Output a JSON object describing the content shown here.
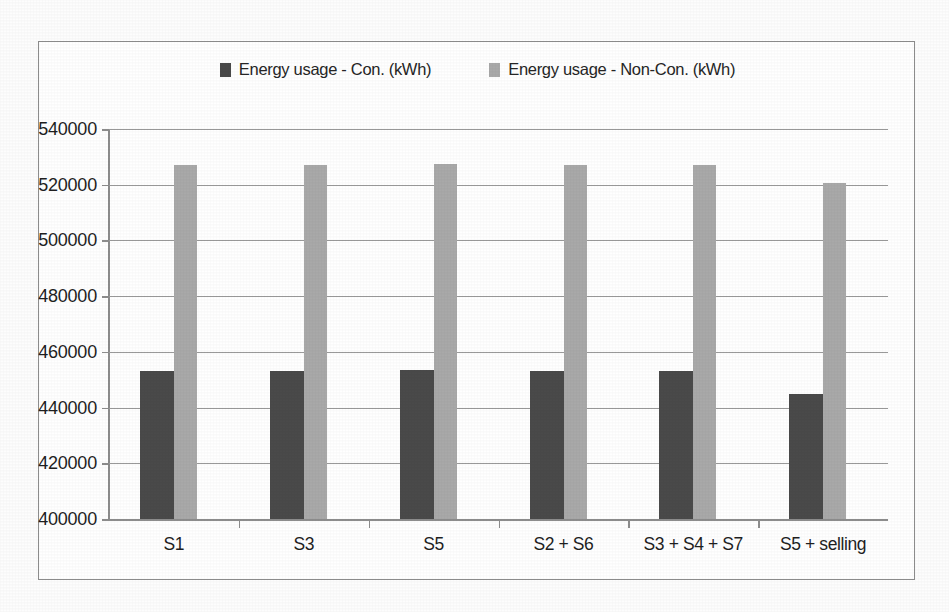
{
  "chart_data": {
    "type": "bar",
    "title": "",
    "xlabel": "",
    "ylabel": "",
    "categories": [
      "S1",
      "S3",
      "S5",
      "S2 + S6",
      "S3 + S4 + S7",
      "S5 + selling"
    ],
    "series": [
      {
        "name": "Energy usage - Con. (kWh)",
        "color": "#4a4a4a",
        "values": [
          453000,
          453000,
          453500,
          453000,
          453000,
          445000
        ]
      },
      {
        "name": "Energy usage - Non-Con. (kWh)",
        "color": "#a9a9a9",
        "values": [
          527000,
          527000,
          527500,
          527000,
          527000,
          520500
        ]
      }
    ],
    "ylim": [
      400000,
      540000
    ],
    "ytick_step": 20000,
    "ytick_labels": [
      "540000",
      "520000",
      "500000",
      "480000",
      "460000",
      "440000",
      "420000",
      "400000"
    ],
    "ytick_values": [
      540000,
      520000,
      500000,
      480000,
      460000,
      440000,
      420000,
      400000
    ],
    "grid": true,
    "legend_position": "top-center"
  },
  "legend": {
    "entries": [
      {
        "label": "Energy usage - Con. (kWh)",
        "color": "#4a4a4a"
      },
      {
        "label": "Energy usage - Non-Con. (kWh)",
        "color": "#a9a9a9"
      }
    ]
  }
}
